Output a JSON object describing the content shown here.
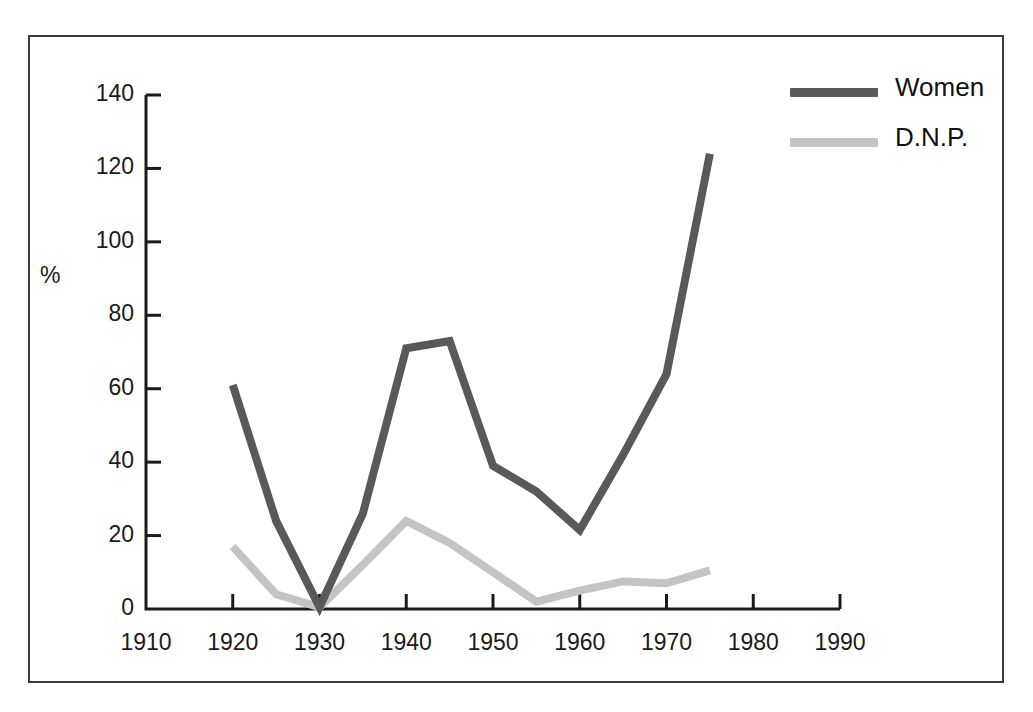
{
  "chart_data": {
    "type": "line",
    "title": "",
    "subtitle": "",
    "xlabel": "",
    "ylabel": "%",
    "xlim": [
      1910,
      1990
    ],
    "ylim": [
      0,
      140
    ],
    "grid": false,
    "legend_position": "top-right",
    "x_ticks": [
      "1910",
      "1920",
      "1930",
      "1940",
      "1950",
      "1960",
      "1970",
      "1980",
      "1990"
    ],
    "y_ticks": [
      "0",
      "20",
      "40",
      "60",
      "80",
      "100",
      "120",
      "140"
    ],
    "series": [
      {
        "name": "Women",
        "color": "#595959",
        "x": [
          1920,
          1925,
          1930,
          1935,
          1940,
          1945,
          1950,
          1955,
          1960,
          1965,
          1970,
          1975
        ],
        "values": [
          61,
          24,
          0.5,
          26,
          71,
          73,
          39,
          32,
          21.5,
          42,
          64,
          124
        ]
      },
      {
        "name": "D.N.P.",
        "color": "#c4c4c4",
        "x": [
          1920,
          1925,
          1930,
          1935,
          1940,
          1945,
          1950,
          1955,
          1960,
          1965,
          1970,
          1975
        ],
        "values": [
          17,
          4,
          0.5,
          12,
          24,
          18,
          10,
          2,
          5,
          7.5,
          7,
          10.5
        ]
      }
    ]
  },
  "legend": {
    "entries": [
      {
        "label": "Women",
        "color": "#595959"
      },
      {
        "label": "D.N.P.",
        "color": "#c4c4c4"
      }
    ]
  },
  "axes": {
    "y_unit_label": "%",
    "axis_color": "#1a1a1a",
    "frame_color": "#3a3a3a"
  }
}
